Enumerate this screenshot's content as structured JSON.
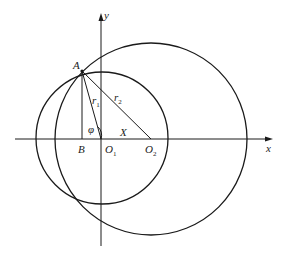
{
  "diagram": {
    "axes": {
      "x_label": "x",
      "y_label": "y"
    },
    "points": {
      "A": "A",
      "B": "B",
      "O1": "O",
      "O1_sub": "1",
      "O2": "O",
      "O2_sub": "2"
    },
    "segments": {
      "r1": "r",
      "r1_sub": "1",
      "r2": "r",
      "r2_sub": "2",
      "X": "X"
    },
    "angle": "φ",
    "circles": [
      {
        "name": "circle-O1",
        "center": "O1",
        "radius_label": "r1"
      },
      {
        "name": "circle-O2",
        "center": "O2",
        "radius_label": "r2"
      }
    ],
    "stroke_color": "#1a1a1a"
  }
}
